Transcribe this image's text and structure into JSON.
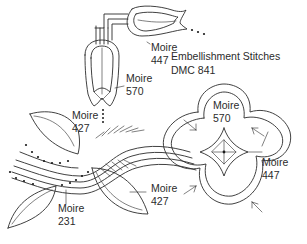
{
  "title": {
    "line1": "Embellishment Stitches",
    "line2": "DMC 841"
  },
  "labels": [
    {
      "name": "Moire",
      "code": "447",
      "target": "top-tulip"
    },
    {
      "name": "Moire",
      "code": "570",
      "target": "middle-tulip"
    },
    {
      "name": "Moire",
      "code": "427",
      "target": "upper-left-leaf"
    },
    {
      "name": "Moire",
      "code": "427",
      "target": "lower-right-leaf"
    },
    {
      "name": "Moire",
      "code": "231",
      "target": "lower-left-leaf"
    },
    {
      "name": "Moire",
      "code": "570",
      "target": "quatrefoil-center"
    },
    {
      "name": "Moire",
      "code": "447",
      "target": "quatrefoil-outline"
    }
  ],
  "colors": {
    "line": "#2b2b2b",
    "background": "#ffffff"
  }
}
